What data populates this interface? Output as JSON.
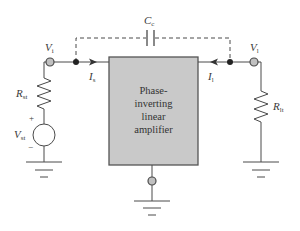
{
  "diagram": {
    "type": "circuit-schematic",
    "amplifier": {
      "lines": [
        "Phase-",
        "inverting",
        "linear",
        "amplifier"
      ]
    },
    "labels": {
      "capacitor": {
        "main": "C",
        "sub": "c"
      },
      "v_left": {
        "main": "V",
        "sub": "i"
      },
      "v_right": {
        "main": "V",
        "sub": "l"
      },
      "i_left": {
        "main": "I",
        "sub": "s"
      },
      "i_right": {
        "main": "I",
        "sub": "l"
      },
      "r_source": {
        "main": "R",
        "sub": "st"
      },
      "v_source": {
        "main": "V",
        "sub": "st"
      },
      "r_load": {
        "main": "R",
        "sub": "lt"
      },
      "plus": "+",
      "minus": "−"
    },
    "colors": {
      "wire": "#4a4a4a",
      "box_fill": "#c9c9c9",
      "box_border": "#555555",
      "terminal_fill": "#c0c0c0",
      "junction": "#222222"
    }
  }
}
